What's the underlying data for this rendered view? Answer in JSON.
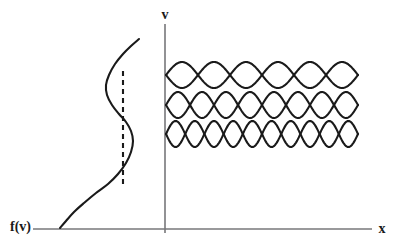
{
  "figure": {
    "background_color": "#ffffff",
    "curve_color": "#1a1a1a",
    "axis_color": "#77777a",
    "labels": {
      "vertical_axis": "v",
      "horizontal_axis": "x",
      "distribution": "f(v)"
    }
  },
  "chart_data": {
    "type": "line",
    "title": "",
    "xlabel": "x",
    "ylabel": "v",
    "grid": false,
    "legend": null,
    "axes": {
      "vertical_axis_label": "v",
      "vertical_axis_x_px": 165,
      "vertical_axis_top_px": 24,
      "vertical_axis_bottom_px": 233,
      "horizontal_axis_label": "x",
      "horizontal_axis_y_px": 229,
      "horizontal_axis_left_px": 33,
      "horizontal_axis_right_px": 372
    },
    "series": [
      {
        "name": "f(v)",
        "kind": "distribution-curve",
        "label": "f(v)",
        "label_position_px": [
          14,
          225
        ],
        "description": "velocity distribution function plotted sideways: rises from origin, bulges to a bump, inflects back, then rises again",
        "points_px": [
          [
            60,
            228
          ],
          [
            66,
            221
          ],
          [
            74,
            212
          ],
          [
            84,
            203
          ],
          [
            96,
            193
          ],
          [
            108,
            184
          ],
          [
            118,
            174
          ],
          [
            126,
            163
          ],
          [
            131,
            152
          ],
          [
            133,
            141
          ],
          [
            131,
            131
          ],
          [
            126,
            122
          ],
          [
            119,
            114
          ],
          [
            112,
            105
          ],
          [
            107,
            95
          ],
          [
            106,
            85
          ],
          [
            109,
            75
          ],
          [
            115,
            64
          ],
          [
            123,
            54
          ],
          [
            131,
            46
          ],
          [
            139,
            39
          ]
        ]
      },
      {
        "name": "resonance marker",
        "kind": "dashed-vertical-line",
        "description": "dashed vertical line marking the resonant velocity region under the bump",
        "x_px": 123,
        "y_top_px": 71,
        "y_bottom_px": 188,
        "dash_pattern": "5,4"
      }
    ],
    "wave_modes": [
      {
        "name": "mode-1",
        "wavelengths": 3,
        "center_y_px": 75,
        "amplitude_px": 13,
        "x_start_px": 166,
        "x_end_px": 358
      },
      {
        "name": "mode-2",
        "wavelengths": 4,
        "center_y_px": 105,
        "amplitude_px": 13,
        "x_start_px": 166,
        "x_end_px": 358
      },
      {
        "name": "mode-3",
        "wavelengths": 5,
        "center_y_px": 134,
        "amplitude_px": 13,
        "x_start_px": 166,
        "x_end_px": 358
      }
    ]
  }
}
